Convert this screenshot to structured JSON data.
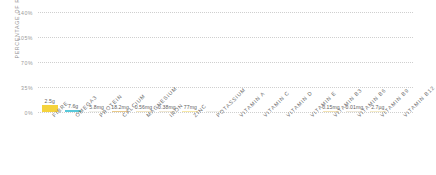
{
  "chart_data": {
    "type": "bar",
    "title": "",
    "subtitle": "",
    "xlabel": "",
    "ylabel": "PERCENTAGE OF RDA",
    "ylim": [
      0,
      140
    ],
    "ytick_labels": [
      "140%",
      "105%",
      "70%",
      "35%",
      "0%"
    ],
    "ytick_values": [
      140,
      105,
      70,
      35,
      0
    ],
    "grid": true,
    "legend": "none",
    "categories": [
      "FIBRE",
      "OMEGA3",
      "PROTEIN",
      "CALCIUM",
      "MAGNESIUM",
      "IRON",
      "ZINC",
      "POTASSIUM",
      "VITAMIN A",
      "VITAMIN C",
      "VITAMIN D",
      "VITAMIN E",
      "VITAMIN B3",
      "VITAMIN B6",
      "VITAMIN B9",
      "VITAMIN B12"
    ],
    "values": [
      10,
      3.4,
      1.6,
      1.8,
      1.6,
      1.5,
      1.8,
      0.9,
      0,
      0,
      0,
      0,
      0.8,
      0.7,
      0.6,
      0.9
    ],
    "data_labels": [
      "2.5g",
      "7.6g",
      "5.8mg",
      "18.2mg",
      "0.56mg",
      "0.38mg",
      "77mg",
      "",
      "",
      "",
      "",
      "",
      "0.15mg",
      "0.01mg",
      "2.7µg",
      ""
    ],
    "bar_colors": [
      "#f5d33c",
      "#57c8da",
      "#f0f0ea",
      "#e8c98a",
      "#f3e6c0",
      "#efe7d2",
      "#f7e9a8",
      "#f0f0ea",
      "#ffffff",
      "#ffffff",
      "#ffffff",
      "#ffffff",
      "#f3e3b4",
      "#efe9da",
      "#f5ecc8",
      "#ffffff"
    ],
    "axis_color": "#9a9a9a",
    "grid_color": "#cfcfcf",
    "label_color": "#6f6f6f"
  }
}
